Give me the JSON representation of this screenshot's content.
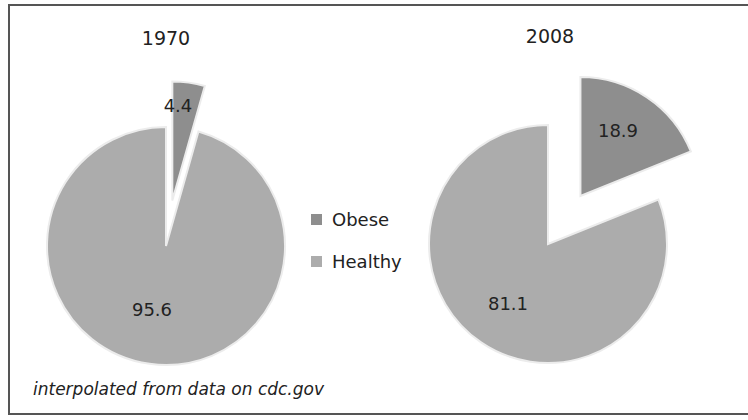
{
  "chart_data": [
    {
      "type": "pie",
      "title": "1970",
      "categories": [
        "Obese",
        "Healthy"
      ],
      "values": [
        4.4,
        95.6
      ],
      "exploded": [
        "Obese"
      ],
      "data_labels": [
        "4.4",
        "95.6"
      ]
    },
    {
      "type": "pie",
      "title": "2008",
      "categories": [
        "Obese",
        "Healthy"
      ],
      "values": [
        18.9,
        81.1
      ],
      "exploded": [
        "Obese"
      ],
      "data_labels": [
        "18.9",
        "81.1"
      ]
    }
  ],
  "legend": {
    "position": "center",
    "items": [
      {
        "label": "Obese",
        "color": "#8e8e8e"
      },
      {
        "label": "Healthy",
        "color": "#acacac"
      }
    ]
  },
  "charts": {
    "left": {
      "title": "1970",
      "obese_label": "4.4",
      "healthy_label": "95.6"
    },
    "right": {
      "title": "2008",
      "obese_label": "18.9",
      "healthy_label": "81.1"
    }
  },
  "colors": {
    "obese": "#8e8e8e",
    "healthy": "#acacac",
    "slice_outline": "#ececec",
    "frame": "#555555"
  },
  "footer": {
    "source": "interpolated from data on cdc.gov"
  }
}
